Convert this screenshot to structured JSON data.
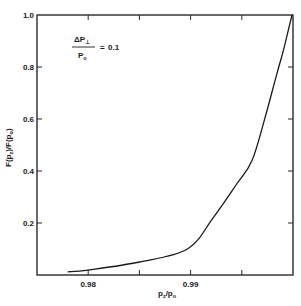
{
  "chart_data": {
    "type": "line",
    "title": "",
    "xlabel": "p_z/p_o",
    "ylabel": "F(p_z)/F(p_o)",
    "xlim": [
      0.975,
      1.0
    ],
    "ylim": [
      0,
      1.0
    ],
    "grid": false,
    "x_ticks": [
      0.975,
      0.98,
      0.985,
      0.99,
      0.995,
      1.0
    ],
    "x_tick_labels": [
      "",
      "0.98",
      "",
      "0.99",
      "",
      ""
    ],
    "y_ticks": [
      0,
      0.2,
      0.4,
      0.6,
      0.8,
      1.0
    ],
    "y_tick_labels": [
      "",
      "0.2",
      "0.4",
      "0.6",
      "0.8",
      "1.0"
    ],
    "annotation": {
      "numerator": "ΔP",
      "numerator_sub": "⊥",
      "denominator": "P",
      "denominator_sub": "o",
      "equals": "=",
      "value": "0.1"
    },
    "series": [
      {
        "name": "F(p_z)/F(p_o)",
        "x": [
          0.978,
          0.98,
          0.985,
          0.9897,
          0.9922,
          0.9945,
          0.996,
          0.9973,
          0.9984,
          0.9991,
          0.9999
        ],
        "y": [
          0.012,
          0.019,
          0.05,
          0.1,
          0.22,
          0.35,
          0.44,
          0.61,
          0.77,
          0.87,
          1.0
        ]
      }
    ],
    "legend": null
  },
  "labels": {
    "x_axis": "p",
    "x_axis_sub1": "z",
    "x_axis_slash": "/p",
    "x_axis_sub2": "o",
    "y_axis_main": "F(p",
    "y_axis_sub1": "z",
    "y_axis_mid": ")/F(p",
    "y_axis_sub2": "o",
    "y_axis_end": ")"
  },
  "colors": {
    "line": "#1a1a1a",
    "axis": "#2a2a2a",
    "background": "#ffffff"
  }
}
